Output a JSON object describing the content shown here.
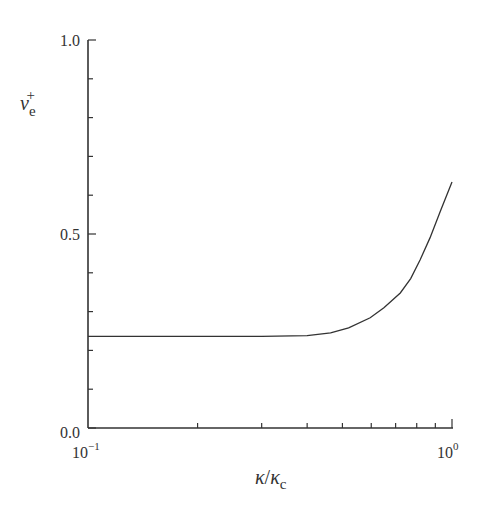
{
  "chart_data": {
    "type": "line",
    "title": "",
    "xlabel": "κ/κc",
    "ylabel": "νe+",
    "xscale": "log",
    "xlim": [
      0.1,
      1.0
    ],
    "ylim": [
      0.0,
      1.0
    ],
    "grid": false,
    "legend": null,
    "x_ticks": [
      {
        "value": 0.1,
        "label_base": "10",
        "label_exp": "−1"
      },
      {
        "value": 1.0,
        "label_base": "10",
        "label_exp": "0"
      }
    ],
    "y_ticks": [
      {
        "value": 0.0,
        "label": "0.0"
      },
      {
        "value": 0.5,
        "label": "0.5"
      },
      {
        "value": 1.0,
        "label": "1.0"
      }
    ],
    "series": [
      {
        "name": "νe+",
        "x": [
          0.1,
          0.15,
          0.2,
          0.3,
          0.4,
          0.464,
          0.52,
          0.596,
          0.65,
          0.721,
          0.77,
          0.817,
          0.87,
          0.93,
          1.0
        ],
        "y": [
          0.236,
          0.236,
          0.236,
          0.236,
          0.238,
          0.245,
          0.258,
          0.284,
          0.31,
          0.348,
          0.385,
          0.433,
          0.49,
          0.56,
          0.634
        ]
      }
    ]
  },
  "labels": {
    "y_axis": {
      "base": "ν",
      "sub": "e",
      "sup": "+"
    },
    "x_axis": {
      "num": "κ",
      "slash": "/",
      "den": "κ",
      "den_sub": "c"
    },
    "y_tick_top": "1.0",
    "y_tick_mid": "0.5",
    "y_tick_bot": "0.0",
    "x_tick_left_base": "10",
    "x_tick_left_exp": "−1",
    "x_tick_right_base": "10",
    "x_tick_right_exp": "0"
  }
}
